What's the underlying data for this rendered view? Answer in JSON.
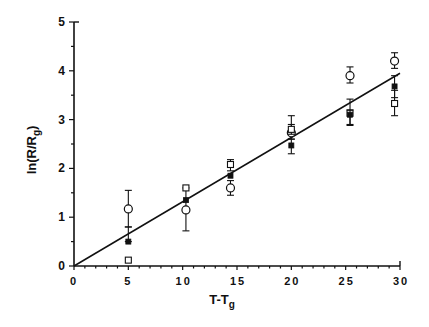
{
  "chart_data": {
    "type": "scatter",
    "title": "",
    "xlabel": "T-T",
    "xlabel_subscript": "g",
    "ylabel": "ln(R/R",
    "ylabel_subscript": "g",
    "ylabel_suffix": ")",
    "xlim": [
      0,
      30
    ],
    "ylim": [
      0,
      5
    ],
    "x_ticks": [
      0,
      5,
      10,
      15,
      20,
      25,
      30
    ],
    "x_tick_labels": [
      "0",
      "5",
      "10",
      "15",
      "20",
      "25",
      "30"
    ],
    "y_ticks": [
      0,
      1,
      2,
      3,
      4,
      5
    ],
    "y_tick_labels": [
      "0",
      "1",
      "2",
      "3",
      "4",
      "5"
    ],
    "grid": false,
    "legend": "none",
    "series": [
      {
        "name": "open-circle",
        "marker": "circle-open",
        "points": [
          {
            "x": 5.0,
            "y": 1.17,
            "err_low": 0.8,
            "err_high": 1.55
          },
          {
            "x": 10.3,
            "y": 1.15,
            "err_low": 0.72,
            "err_high": 1.6
          },
          {
            "x": 14.4,
            "y": 1.6,
            "err_low": 1.45,
            "err_high": 1.75
          },
          {
            "x": 20.0,
            "y": 2.73,
            "err_low": 2.6,
            "err_high": 2.9
          },
          {
            "x": 25.4,
            "y": 3.9,
            "err_low": 3.75,
            "err_high": 4.08
          },
          {
            "x": 29.5,
            "y": 4.2,
            "err_low": 4.05,
            "err_high": 4.37
          }
        ]
      },
      {
        "name": "open-square",
        "marker": "square-open",
        "points": [
          {
            "x": 5.0,
            "y": 0.12,
            "err_low": 0.12,
            "err_high": 0.12
          },
          {
            "x": 10.3,
            "y": 1.6,
            "err_low": 1.6,
            "err_high": 1.6
          },
          {
            "x": 14.4,
            "y": 2.08,
            "err_low": 1.95,
            "err_high": 2.18
          },
          {
            "x": 20.0,
            "y": 2.8,
            "err_low": 2.7,
            "err_high": 3.08
          },
          {
            "x": 25.4,
            "y": 3.13,
            "err_low": 2.9,
            "err_high": 3.42
          },
          {
            "x": 29.5,
            "y": 3.33,
            "err_low": 3.08,
            "err_high": 3.6
          }
        ]
      },
      {
        "name": "filled-square",
        "marker": "square-filled",
        "points": [
          {
            "x": 5.0,
            "y": 0.5,
            "err_low": 0.5,
            "err_high": 0.8
          },
          {
            "x": 10.3,
            "y": 1.35,
            "err_low": 1.35,
            "err_high": 1.35
          },
          {
            "x": 14.4,
            "y": 1.85,
            "err_low": 1.85,
            "err_high": 1.85
          },
          {
            "x": 20.0,
            "y": 2.47,
            "err_low": 2.3,
            "err_high": 2.6
          },
          {
            "x": 25.4,
            "y": 3.1,
            "err_low": 2.88,
            "err_high": 3.2
          },
          {
            "x": 29.5,
            "y": 3.68,
            "err_low": 3.45,
            "err_high": 3.9
          }
        ]
      }
    ],
    "fit_line": {
      "x": [
        0,
        30
      ],
      "y": [
        0,
        3.95
      ]
    }
  }
}
